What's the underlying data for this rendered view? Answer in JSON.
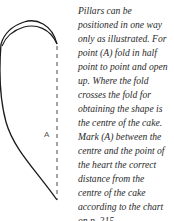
{
  "figure": {
    "label": "A",
    "outline_color": "#1a1a1a",
    "fold_line_color": "#333333"
  },
  "caption": {
    "lines": [
      "Pillars can be",
      "positioned in one way",
      "only as illustrated. For",
      "point (A) fold in half",
      "point to point and open",
      "up. Where the fold",
      "crosses the fold for",
      "obtaining the shape is",
      "the centre of the cake.",
      "Mark (A) between the",
      "centre and the point of",
      "the heart the correct",
      "distance from the",
      "centre of the cake",
      "according to the chart",
      "on p. 215."
    ]
  }
}
